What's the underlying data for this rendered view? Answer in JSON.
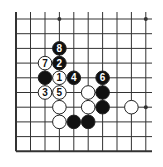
{
  "diagram": {
    "type": "go-board-fragment",
    "grid": {
      "columns_x": [
        16,
        30.5,
        45,
        59.4,
        73.8,
        88.2,
        102.6,
        117,
        131.4,
        145.8
      ],
      "rows_y": [
        19,
        33.7,
        48.4,
        63.1,
        77.8,
        92.5,
        107.2,
        121.9,
        136.6,
        151.3
      ],
      "left_edge": true,
      "bottom_edge": true,
      "top_edge": false,
      "right_edge": false,
      "extend_top_to": 12,
      "extend_right_to": 152,
      "line_color": "#333333"
    },
    "star_points": [
      {
        "col": 3,
        "row": 0
      },
      {
        "col": 9,
        "row": 0
      },
      {
        "col": 9,
        "row": 6
      }
    ],
    "stones": [
      {
        "color": "black",
        "col": 3,
        "row": 2,
        "label": "8"
      },
      {
        "color": "white",
        "col": 2,
        "row": 3,
        "label": "7"
      },
      {
        "color": "black",
        "col": 3,
        "row": 3,
        "label": "2"
      },
      {
        "color": "black",
        "col": 2,
        "row": 4,
        "label": ""
      },
      {
        "color": "white",
        "col": 3,
        "row": 4,
        "label": "1"
      },
      {
        "color": "black",
        "col": 4,
        "row": 4,
        "label": "4"
      },
      {
        "color": "black",
        "col": 6,
        "row": 4,
        "label": "6"
      },
      {
        "color": "white",
        "col": 2,
        "row": 5,
        "label": "3"
      },
      {
        "color": "white",
        "col": 3,
        "row": 5,
        "label": "5"
      },
      {
        "color": "white",
        "col": 5,
        "row": 5,
        "label": ""
      },
      {
        "color": "black",
        "col": 6,
        "row": 5,
        "label": ""
      },
      {
        "color": "white",
        "col": 3,
        "row": 6,
        "label": ""
      },
      {
        "color": "white",
        "col": 5,
        "row": 6,
        "label": ""
      },
      {
        "color": "black",
        "col": 6,
        "row": 6,
        "label": ""
      },
      {
        "color": "white",
        "col": 8,
        "row": 6,
        "label": ""
      },
      {
        "color": "white",
        "col": 3,
        "row": 7,
        "label": ""
      },
      {
        "color": "black",
        "col": 4,
        "row": 7,
        "label": ""
      },
      {
        "color": "black",
        "col": 5,
        "row": 7,
        "label": ""
      }
    ],
    "colors": {
      "black_stone": "#111111",
      "white_stone": "#ffffff",
      "stone_outline": "#222222",
      "background": "#ffffff"
    }
  }
}
